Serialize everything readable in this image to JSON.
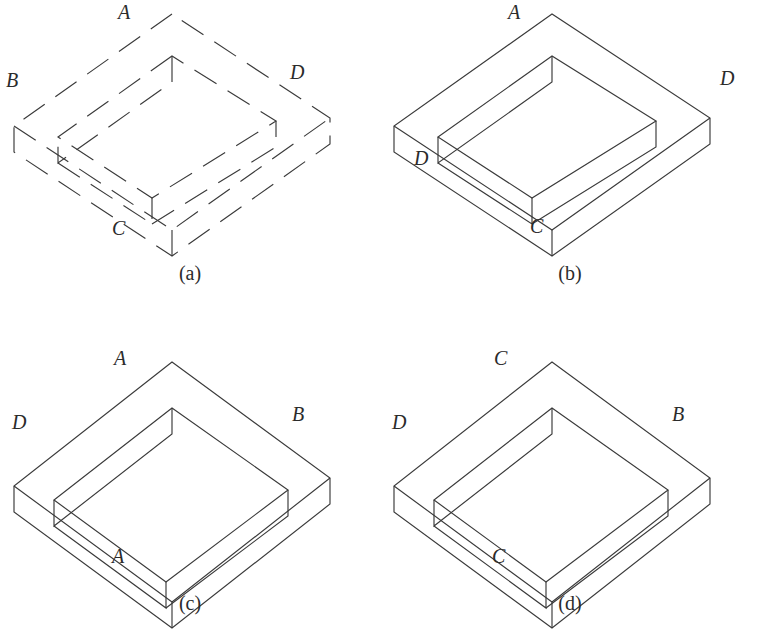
{
  "sheet": {
    "title": "Isometric rectangular frame figures (a)-(d)",
    "background_color": "#ffffff",
    "stroke_color": "#3a3a3a",
    "width": 760,
    "height": 640
  },
  "figures": [
    {
      "key": "a",
      "caption": "(a)",
      "line_style": "dashed",
      "geometry": "wide-diamond",
      "labels": [
        {
          "text": "A",
          "position": "top",
          "x": 118,
          "y": 2
        },
        {
          "text": "B",
          "position": "left",
          "x": 6,
          "y": 70
        },
        {
          "text": "C",
          "position": "bottom",
          "x": 112,
          "y": 218
        },
        {
          "text": "D",
          "position": "right",
          "x": 290,
          "y": 62
        }
      ]
    },
    {
      "key": "b",
      "caption": "(b)",
      "line_style": "solid",
      "geometry": "wide-diamond",
      "labels": [
        {
          "text": "A",
          "position": "top",
          "x": 128,
          "y": 2
        },
        {
          "text": "D",
          "position": "left",
          "x": 34,
          "y": 148
        },
        {
          "text": "C",
          "position": "bottom",
          "x": 150,
          "y": 216
        },
        {
          "text": "D",
          "position": "right",
          "x": 340,
          "y": 68
        }
      ]
    },
    {
      "key": "c",
      "caption": "(c)",
      "line_style": "solid",
      "geometry": "square-diamond",
      "labels": [
        {
          "text": "A",
          "position": "top",
          "x": 114,
          "y": 28
        },
        {
          "text": "D",
          "position": "left",
          "x": 12,
          "y": 92
        },
        {
          "text": "A",
          "position": "bottom",
          "x": 112,
          "y": 226
        },
        {
          "text": "B",
          "position": "right",
          "x": 292,
          "y": 84
        }
      ]
    },
    {
      "key": "d",
      "caption": "(d)",
      "line_style": "solid",
      "geometry": "square-diamond",
      "labels": [
        {
          "text": "C",
          "position": "top",
          "x": 114,
          "y": 28
        },
        {
          "text": "D",
          "position": "left",
          "x": 12,
          "y": 92
        },
        {
          "text": "C",
          "position": "bottom",
          "x": 112,
          "y": 226
        },
        {
          "text": "B",
          "position": "right",
          "x": 292,
          "y": 84
        }
      ]
    }
  ],
  "shapes": {
    "wide-diamond": {
      "description": "Isometric hollow rectangular frame, wide shallow diamond",
      "outer_top": [
        172,
        14
      ],
      "outer_left": [
        14,
        126
      ],
      "outer_bottom": [
        172,
        230
      ],
      "outer_right": [
        330,
        118
      ],
      "slab_depth": 26,
      "rim_width": 38,
      "paths": [
        "M172,14 L14,126 L14,152 L172,256 L330,144 L330,118 Z",
        "M14,126 L172,230 L330,118",
        "M172,230 L172,256",
        "M172,56 L58,137 L152,198 L276,121 Z",
        "M172,56 L172,82 L58,163 L58,137",
        "M58,163 L152,224 L152,198",
        "M152,224 L276,147 L276,121"
      ]
    },
    "square-diamond": {
      "description": "Isometric hollow rectangular frame, symmetric diamond",
      "outer_top": [
        172,
        362
      ],
      "outer_left": [
        14,
        486
      ],
      "outer_bottom": [
        172,
        602
      ],
      "outer_right": [
        330,
        478
      ],
      "slab_depth": 26,
      "rim_width": 44,
      "paths": [
        "M172,362 L14,486 L14,512 L172,628 L330,504 L330,478 Z",
        "M14,486 L172,602 L330,478",
        "M172,602 L172,628",
        "M172,408 L54,500 L166,582 L288,490 Z",
        "M172,408 L172,434 L54,526 L54,500",
        "M54,526 L166,608 L166,582",
        "M166,608 L288,516 L288,490"
      ]
    }
  }
}
